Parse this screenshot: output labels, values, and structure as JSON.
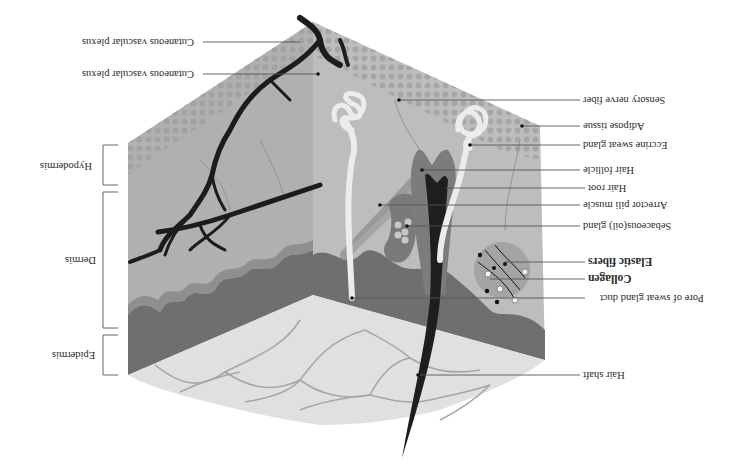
{
  "diagram": {
    "orientation": "rotated-180",
    "colors": {
      "background": "#ffffff",
      "hypodermis_face": "#b3b3b3",
      "dermis_face": "#a8a8a8",
      "epidermis_dark": "#6e6e6e",
      "surface_light": "#dedede",
      "vessel": "#1c1c1c",
      "gland": "#e6e6e6",
      "follicle": "#7a7a7a",
      "leader_line": "#555555"
    },
    "layers": [
      {
        "name": "Hypodermis",
        "label": "Hypodermis"
      },
      {
        "name": "Dermis",
        "label": "Dermis"
      },
      {
        "name": "Epidermis",
        "label": "Epidermis"
      }
    ],
    "labels": [
      {
        "id": "vascular-plexus-1",
        "text": "Cutaneous vascular plexus",
        "bold": false
      },
      {
        "id": "vascular-plexus-2",
        "text": "Cutaneous vascular plexus",
        "bold": false
      },
      {
        "id": "sensory-nerve-fiber",
        "text": "Sensory nerve fiber",
        "bold": false
      },
      {
        "id": "adipose-tissue",
        "text": "Adipose tissue",
        "bold": false
      },
      {
        "id": "eccrine-sweat-gland",
        "text": "Eccrine sweat gland",
        "bold": false
      },
      {
        "id": "hair-follicle",
        "text": "Hair follicle",
        "bold": false
      },
      {
        "id": "hair-root",
        "text": "Hair root",
        "bold": false
      },
      {
        "id": "arrector-pili-muscle",
        "text": "Arrector pili muscle",
        "bold": false
      },
      {
        "id": "sebaceous-gland",
        "text": "Sebaceous(oil) gland",
        "bold": false
      },
      {
        "id": "elastic-fibers",
        "text": "Elastic fibers",
        "bold": true
      },
      {
        "id": "collagen",
        "text": "Collagen",
        "bold": true
      },
      {
        "id": "pore-of-sweat-gland-duct",
        "text": "Pore of sweat gland duct",
        "bold": false
      },
      {
        "id": "hair-shaft",
        "text": "Hair shaft",
        "bold": false
      }
    ]
  }
}
